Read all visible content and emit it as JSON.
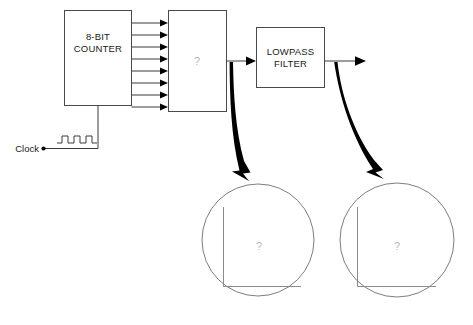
{
  "diagram": {
    "blocks": {
      "counter": {
        "label_line1": "8-BIT",
        "label_line2": "COUNTER",
        "name": "counter-block"
      },
      "dac": {
        "label": "?",
        "name": "dac-block"
      },
      "filter": {
        "label_line1": "LOWPASS",
        "label_line2": "FILTER",
        "name": "lowpass-filter-block"
      }
    },
    "clock": {
      "label": "Clock",
      "waveform": "square-wave",
      "pulses": 3
    },
    "bus": {
      "line_count": 8,
      "description": "8 parallel signal lines from counter to DAC"
    },
    "insets": [
      {
        "name": "dac-output-waveform-inset",
        "label": "?",
        "axes": "x-y-axes"
      },
      {
        "name": "filter-output-waveform-inset",
        "label": "?",
        "axes": "x-y-axes"
      }
    ],
    "callouts": [
      {
        "name": "dac-output-callout-arrow",
        "style": "thick-curved"
      },
      {
        "name": "filter-output-callout-arrow",
        "style": "thick-curved"
      }
    ],
    "colors": {
      "background": "#ffffff",
      "box_stroke": "#4a4a4a",
      "wire": "#3a3a3a",
      "text": "#1a1a1a",
      "placeholder_text": "#b9b9b9",
      "circle_stroke": "#6e6e6e",
      "axis": "#8a8a8a",
      "callout_arrow": "#000000"
    }
  }
}
